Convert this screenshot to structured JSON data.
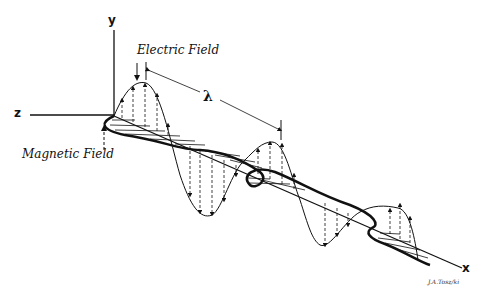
{
  "diagram": {
    "labels": {
      "electric_field": "Electric Field",
      "magnetic_field": "Magnetic Field",
      "wavelength": "λ",
      "axis_x": "x",
      "axis_y": "y",
      "axis_z": "z",
      "signature": "J.A.Tosz/ki"
    },
    "colors": {
      "ink": "#111111",
      "background": "#ffffff"
    }
  }
}
